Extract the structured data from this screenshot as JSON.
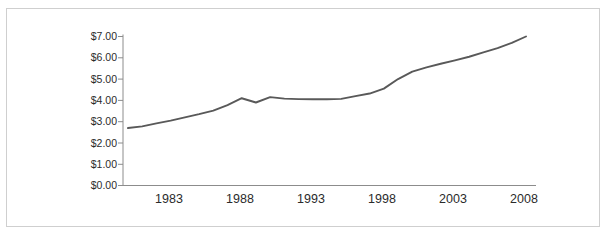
{
  "chart_data": {
    "type": "line",
    "title": "",
    "subtitle": "",
    "xlabel": "",
    "ylabel": "",
    "xlim": [
      1980,
      2008
    ],
    "ylim": [
      0,
      7
    ],
    "grid": false,
    "legend": false,
    "legend_position": "none",
    "y_ticks": [
      0,
      1,
      2,
      3,
      4,
      5,
      6,
      7
    ],
    "y_tick_labels": [
      "$0.00",
      "$1.00",
      "$2.00",
      "$3.00",
      "$4.00",
      "$5.00",
      "$6.00",
      "$7.00"
    ],
    "x_ticks": [
      1983,
      1988,
      1993,
      1998,
      2003,
      2008
    ],
    "x_tick_labels": [
      "1983",
      "1988",
      "1993",
      "1998",
      "2003",
      "2008"
    ],
    "x": [
      1980,
      1981,
      1982,
      1983,
      1984,
      1985,
      1986,
      1987,
      1988,
      1989,
      1990,
      1991,
      1992,
      1993,
      1994,
      1995,
      1996,
      1997,
      1998,
      1999,
      2000,
      2001,
      2002,
      2003,
      2004,
      2005,
      2006,
      2007,
      2008
    ],
    "values": [
      2.7,
      2.78,
      2.92,
      3.05,
      3.2,
      3.35,
      3.52,
      3.78,
      4.1,
      3.9,
      4.15,
      4.08,
      4.06,
      4.05,
      4.05,
      4.07,
      4.2,
      4.32,
      4.55,
      5.0,
      5.35,
      5.55,
      5.72,
      5.88,
      6.05,
      6.25,
      6.45,
      6.7,
      7.0
    ],
    "series": [
      {
        "name": "Price",
        "color": "#595959",
        "values": [
          2.7,
          2.78,
          2.92,
          3.05,
          3.2,
          3.35,
          3.52,
          3.78,
          4.1,
          3.9,
          4.15,
          4.08,
          4.06,
          4.05,
          4.05,
          4.07,
          4.2,
          4.32,
          4.55,
          5.0,
          5.35,
          5.55,
          5.72,
          5.88,
          6.05,
          6.25,
          6.45,
          6.7,
          7.0
        ]
      }
    ],
    "colors": {
      "line": "#595959",
      "axis": "#8c8c8c",
      "text": "#2b2b2b",
      "frame": "#cfcfcf",
      "background": "#ffffff"
    }
  },
  "frame": {
    "border_color": "#cfcfcf"
  }
}
